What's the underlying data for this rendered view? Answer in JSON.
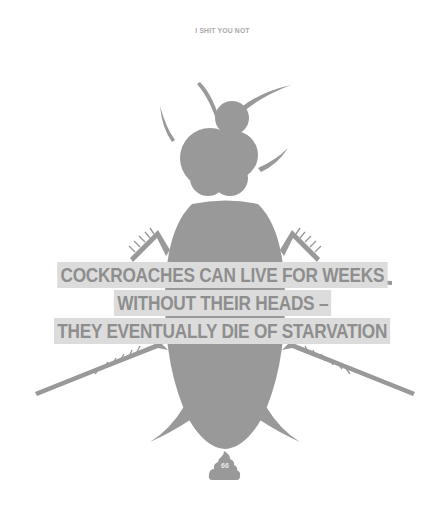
{
  "header": {
    "title": "I SHIT YOU NOT"
  },
  "fact": {
    "lines": [
      "COCKROACHES CAN LIVE FOR WEEKS",
      "WITHOUT THEIR HEADS –",
      "THEY EVENTUALLY DIE OF STARVATION"
    ]
  },
  "illustration": {
    "subject": "cockroach-silhouette",
    "fill_color": "#999999",
    "banner_color": "#dcdcdc",
    "text_color": "#8e8e8e"
  },
  "footer": {
    "icon": "poop-icon",
    "page_number": "66"
  }
}
